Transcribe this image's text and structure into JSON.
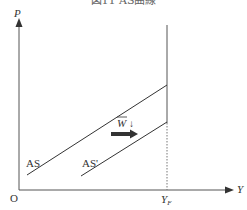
{
  "caption": "図11 AS曲線",
  "axes": {
    "y_label": "P",
    "x_label": "Y",
    "origin_label": "O",
    "x_marker_label": "Y",
    "x_marker_subscript": "F"
  },
  "curves": [
    {
      "name": "AS",
      "label": "AS"
    },
    {
      "name": "AS-prime",
      "label": "AS'"
    }
  ],
  "annotation": {
    "shift_label": "W",
    "shift_direction": "↓",
    "arrow_direction": "right"
  },
  "colors": {
    "line": "#333333",
    "axis": "#555555",
    "arrow": "#333333"
  }
}
